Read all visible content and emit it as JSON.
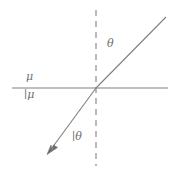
{
  "figure": {
    "kind": "refraction-ray-diagram",
    "background_color": "#ffffff",
    "stroke_color": "#808080",
    "text_color": "#6e6e6e",
    "labels": {
      "medium_upper": "μ",
      "medium_lower": "∣μ",
      "angle_upper": "θ",
      "angle_lower": "∣θ"
    },
    "geometry": {
      "interface_line": {
        "x1": 12,
        "y1": 88,
        "x2": 168,
        "y2": 88
      },
      "normal_dashed_line": {
        "x1": 96,
        "y1": 10,
        "x2": 96,
        "y2": 166
      },
      "upper_ray": {
        "x1": 96,
        "y1": 88,
        "x2": 166,
        "y2": 17
      },
      "lower_ray": {
        "x1": 96,
        "y1": 88,
        "x2": 48,
        "y2": 153
      },
      "arrow_tip": {
        "x": 48,
        "y": 153
      },
      "origin": {
        "x": 96,
        "y": 88
      }
    }
  }
}
